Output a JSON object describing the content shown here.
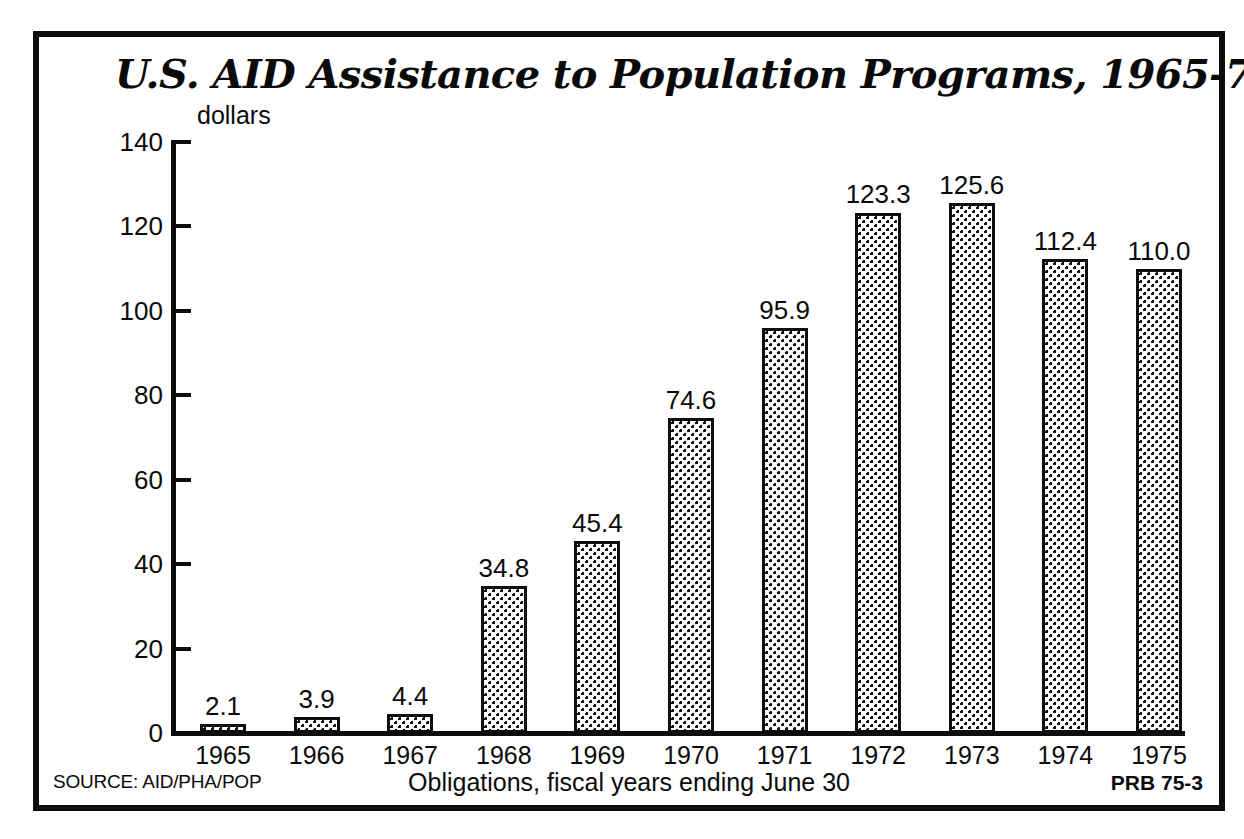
{
  "chart_data": {
    "type": "bar",
    "title": "U.S. AID Assistance to Population Programs, 1965-75",
    "subtitle": "",
    "ylabel": "dollars",
    "xlabel": "Obligations, fiscal years ending June 30",
    "categories": [
      "1965",
      "1966",
      "1967",
      "1968",
      "1969",
      "1970",
      "1971",
      "1972",
      "1973",
      "1974",
      "1975"
    ],
    "values": [
      2.1,
      3.9,
      4.4,
      34.8,
      45.4,
      74.6,
      95.9,
      123.3,
      125.6,
      112.4,
      110.0
    ],
    "value_labels": [
      "2.1",
      "3.9",
      "4.4",
      "34.8",
      "45.4",
      "74.6",
      "95.9",
      "123.3",
      "125.6",
      "112.4",
      "110.0"
    ],
    "ylim": [
      0,
      140
    ],
    "yticks": [
      0,
      20,
      40,
      60,
      80,
      100,
      120,
      140
    ],
    "ytick_labels": [
      "0",
      "20",
      "40",
      "60",
      "80",
      "100",
      "120",
      "140"
    ],
    "grid": false,
    "legend": "none",
    "bar_fill": "dotted-stipple",
    "bar_outline_color": "#0d0d0d",
    "background_color": "#ffffff"
  },
  "footer": {
    "source": "SOURCE: AID/PHA/POP",
    "note": "Obligations, fiscal years ending June 30",
    "code": "PRB 75-3"
  }
}
